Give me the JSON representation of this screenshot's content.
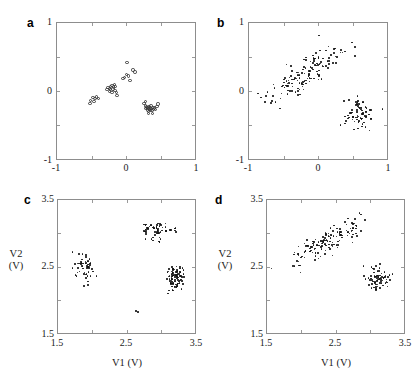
{
  "figure": {
    "panels": [
      {
        "id": "a",
        "letter": "a",
        "marker": "open-circle",
        "xlim": [
          -1,
          1
        ],
        "ylim": [
          -1,
          1
        ],
        "xticks": [
          -1,
          0,
          1
        ],
        "yticks": [
          -1,
          0,
          1
        ],
        "xtick_labels": [
          "-1",
          "0",
          "1"
        ],
        "ytick_labels": [
          "-1",
          "0",
          "1"
        ],
        "xlabel": "",
        "ylabel": ""
      },
      {
        "id": "b",
        "letter": "b",
        "marker": "dot",
        "xlim": [
          -1,
          1
        ],
        "ylim": [
          -1,
          1
        ],
        "xticks": [
          -1,
          0,
          1
        ],
        "yticks": [
          -1,
          0,
          1
        ],
        "xtick_labels": [
          "-1",
          "0",
          "1"
        ],
        "ytick_labels": [
          "-1",
          "0",
          "1"
        ],
        "xlabel": "",
        "ylabel": ""
      },
      {
        "id": "c",
        "letter": "c",
        "marker": "dot",
        "xlim": [
          1.5,
          3.5
        ],
        "ylim": [
          1.5,
          3.5
        ],
        "xticks": [
          1.5,
          2.5,
          3.5
        ],
        "yticks": [
          1.5,
          2.5,
          3.5
        ],
        "xtick_labels": [
          "1.5",
          "2.5",
          "3.5"
        ],
        "ytick_labels": [
          "1.5",
          "2.5",
          "3.5"
        ],
        "xlabel": "V1 (V)",
        "ylabel_line1": "V2",
        "ylabel_line2": "(V)"
      },
      {
        "id": "d",
        "letter": "d",
        "marker": "dot",
        "xlim": [
          1.5,
          3.5
        ],
        "ylim": [
          1.5,
          3.5
        ],
        "xticks": [
          1.5,
          2.5,
          3.5
        ],
        "yticks": [
          1.5,
          2.5,
          3.5
        ],
        "xtick_labels": [
          "1.5",
          "2.5",
          "3.5"
        ],
        "ytick_labels": [
          "1.5",
          "2.5",
          "3.5"
        ],
        "xlabel": "V1 (V)",
        "ylabel_line1": "V2",
        "ylabel_line2": "(V)"
      }
    ]
  },
  "chart_data": [
    {
      "type": "scatter",
      "panel": "a",
      "title": "",
      "xlabel": "",
      "ylabel": "",
      "xlim": [
        -1,
        1
      ],
      "ylim": [
        -1,
        1
      ],
      "xticks": [
        -1,
        0,
        1
      ],
      "yticks": [
        -1,
        0,
        1
      ],
      "grid": false,
      "legend": null,
      "marker": "open-circle",
      "n_points": 48,
      "clusters": [
        {
          "name": "diagonal-band",
          "center": [
            -0.18,
            0.08
          ],
          "n": 26
        },
        {
          "name": "lower-right",
          "center": [
            0.33,
            -0.24
          ],
          "n": 22
        }
      ],
      "points": [
        [
          -0.535,
          -0.115
        ],
        [
          -0.505,
          -0.075
        ],
        [
          -0.475,
          -0.085
        ],
        [
          -0.455,
          -0.065
        ],
        [
          -0.425,
          -0.085
        ],
        [
          -0.545,
          -0.155
        ],
        [
          -0.49,
          -0.13
        ],
        [
          -0.3,
          0.045
        ],
        [
          -0.285,
          0.075
        ],
        [
          -0.265,
          0.065
        ],
        [
          -0.25,
          0.09
        ],
        [
          -0.245,
          0.045
        ],
        [
          -0.225,
          0.105
        ],
        [
          -0.215,
          0.055
        ],
        [
          -0.205,
          0.085
        ],
        [
          -0.195,
          0.12
        ],
        [
          -0.185,
          0.035
        ],
        [
          -0.175,
          0.095
        ],
        [
          -0.165,
          0.005
        ],
        [
          -0.265,
          0.02
        ],
        [
          -0.23,
          0.0
        ],
        [
          -0.155,
          -0.04
        ],
        [
          -0.07,
          0.205
        ],
        [
          -0.045,
          0.225
        ],
        [
          -0.02,
          0.265
        ],
        [
          0.015,
          0.245
        ],
        [
          0.035,
          0.175
        ],
        [
          0.075,
          0.335
        ],
        [
          0.105,
          0.305
        ],
        [
          -0.01,
          0.44
        ],
        [
          0.235,
          -0.16
        ],
        [
          0.255,
          -0.195
        ],
        [
          0.265,
          -0.235
        ],
        [
          0.275,
          -0.21
        ],
        [
          0.285,
          -0.255
        ],
        [
          0.295,
          -0.225
        ],
        [
          0.3,
          -0.275
        ],
        [
          0.31,
          -0.205
        ],
        [
          0.315,
          -0.245
        ],
        [
          0.325,
          -0.225
        ],
        [
          0.33,
          -0.265
        ],
        [
          0.335,
          -0.195
        ],
        [
          0.345,
          -0.235
        ],
        [
          0.355,
          -0.26
        ],
        [
          0.365,
          -0.215
        ],
        [
          0.375,
          -0.245
        ],
        [
          0.385,
          -0.225
        ],
        [
          0.405,
          -0.25
        ],
        [
          0.425,
          -0.205
        ],
        [
          0.44,
          -0.165
        ],
        [
          0.255,
          -0.125
        ],
        [
          0.36,
          -0.305
        ],
        [
          0.3,
          -0.31
        ]
      ]
    },
    {
      "type": "scatter",
      "panel": "b",
      "title": "",
      "xlabel": "",
      "ylabel": "",
      "xlim": [
        -1,
        1
      ],
      "ylim": [
        -1,
        1
      ],
      "xticks": [
        -1,
        0,
        1
      ],
      "yticks": [
        -1,
        0,
        1
      ],
      "grid": false,
      "legend": null,
      "marker": "dot",
      "n_points": 210,
      "clusters": [
        {
          "name": "diagonal-band",
          "center": [
            -0.18,
            0.27
          ],
          "n": 140,
          "spread": [
            0.28,
            0.12
          ],
          "slope": 0.62
        },
        {
          "name": "lower-right",
          "center": [
            0.58,
            -0.33
          ],
          "n": 70,
          "spread": [
            0.14,
            0.11
          ]
        }
      ]
    },
    {
      "type": "scatter",
      "panel": "c",
      "title": "",
      "xlabel": "V1 (V)",
      "ylabel": "V2 (V)",
      "xlim": [
        1.5,
        3.5
      ],
      "ylim": [
        1.5,
        3.5
      ],
      "xticks": [
        1.5,
        2.5,
        3.5
      ],
      "yticks": [
        1.5,
        2.5,
        3.5
      ],
      "grid": false,
      "legend": null,
      "marker": "dot",
      "n_points": 205,
      "clusters": [
        {
          "name": "left-cluster",
          "center": [
            1.87,
            2.5
          ],
          "n": 55,
          "spread": [
            0.09,
            0.11
          ]
        },
        {
          "name": "top-cluster",
          "center": [
            2.93,
            3.06
          ],
          "n": 60,
          "spread": [
            0.14,
            0.07
          ]
        },
        {
          "name": "right-cluster",
          "center": [
            3.19,
            2.34
          ],
          "n": 88,
          "spread": [
            0.07,
            0.09
          ]
        },
        {
          "name": "outlier",
          "center": [
            2.6,
            1.83
          ],
          "n": 2
        }
      ]
    },
    {
      "type": "scatter",
      "panel": "d",
      "title": "",
      "xlabel": "V1 (V)",
      "ylabel": "V2 (V)",
      "xlim": [
        1.5,
        3.5
      ],
      "ylim": [
        1.5,
        3.5
      ],
      "xticks": [
        1.5,
        2.5,
        3.5
      ],
      "yticks": [
        1.5,
        2.5,
        3.5
      ],
      "grid": false,
      "legend": null,
      "marker": "dot",
      "n_points": 215,
      "clusters": [
        {
          "name": "diagonal-band",
          "center": [
            2.35,
            2.9
          ],
          "n": 145,
          "spread": [
            0.28,
            0.1
          ],
          "slope": 0.55
        },
        {
          "name": "lower-right",
          "center": [
            3.1,
            2.32
          ],
          "n": 70,
          "spread": [
            0.08,
            0.09
          ]
        }
      ]
    }
  ]
}
